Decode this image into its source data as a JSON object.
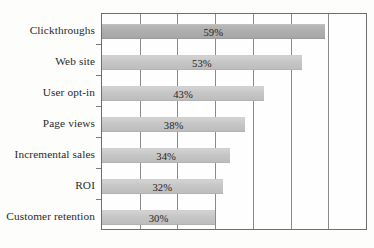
{
  "chart_data": {
    "type": "bar",
    "orientation": "horizontal",
    "title": "",
    "subtitle": "",
    "xlabel": "",
    "ylabel": "",
    "categories": [
      "Clickthroughs",
      "Web site",
      "User opt-in",
      "Page views",
      "Incremental sales",
      "ROI",
      "Customer retention"
    ],
    "values": [
      59,
      53,
      43,
      38,
      34,
      32,
      30
    ],
    "value_labels": [
      "59%",
      "53%",
      "43%",
      "38%",
      "34%",
      "32%",
      "30%"
    ],
    "unit": "%",
    "xlim": [
      0,
      70
    ],
    "ylim": null,
    "gridlines": {
      "vertical": true,
      "horizontal": false,
      "x_positions": [
        0,
        10,
        20,
        30,
        40,
        50,
        60,
        70
      ]
    },
    "tick_labels": {
      "x": [],
      "y": [
        "Clickthroughs",
        "Web site",
        "User opt-in",
        "Page views",
        "Incremental sales",
        "ROI",
        "Customer retention"
      ]
    },
    "legend": {
      "visible": false,
      "position": "none",
      "entries": []
    },
    "annotations": [],
    "colors": {
      "bar_fill": "#c6c6c6",
      "bar_fill_emphasis": "#aeaeae",
      "grid": "#8a8a8a",
      "frame": "#6e6e6e",
      "text": "#242424",
      "background": "#fdfdfc"
    },
    "series": [
      {
        "name": "Metric importance",
        "values": [
          59,
          53,
          43,
          38,
          34,
          32,
          30
        ]
      }
    ]
  }
}
